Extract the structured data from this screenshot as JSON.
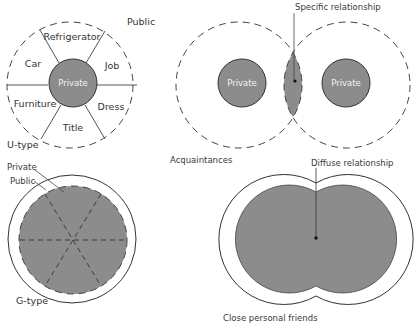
{
  "colors": {
    "private_fill": "#8c8c8c",
    "line": "#444444",
    "background": "#ffffff"
  },
  "u_type": {
    "label": "U-type",
    "public_label": "Public",
    "private_label": "Private",
    "sectors": [
      "Refrigerator",
      "Job",
      "Dress",
      "Title",
      "Furniture",
      "Car"
    ]
  },
  "g_type": {
    "label": "G-type",
    "private_label": "Private",
    "public_label": "Public"
  },
  "acquaintances": {
    "label": "Acquaintances",
    "left_private_label": "Private",
    "right_private_label": "Private",
    "relationship_label": "Specific relationship"
  },
  "close_friends": {
    "label": "Close personal friends",
    "relationship_label": "Diffuse relationship"
  }
}
